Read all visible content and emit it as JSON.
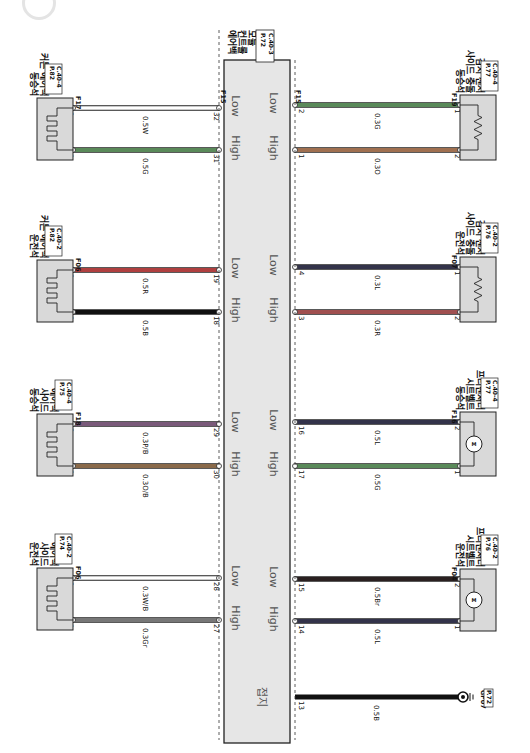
{
  "module": {
    "name_lines": [
      "에어백",
      "컨트롤",
      "모듈"
    ],
    "refs": [
      "P.72",
      "C.40-3"
    ],
    "ground_label": "접지"
  },
  "components": [
    {
      "id": "top-left-1",
      "name_lines": [
        "동승석",
        "커튼 에어백"
      ],
      "refs": [
        "P.82",
        "C.40-4"
      ],
      "connector": "F17",
      "type": "heater"
    },
    {
      "id": "top-left-2",
      "name_lines": [
        "운전석",
        "커튼 에어백"
      ],
      "refs": [
        "P.82",
        "C.40-2"
      ],
      "connector": "F06",
      "type": "heater"
    },
    {
      "id": "top-left-3",
      "name_lines": [
        "동승석",
        "사이드",
        "에어백"
      ],
      "refs": [
        "P.75",
        "C.40-4"
      ],
      "connector": "F18",
      "type": "heater"
    },
    {
      "id": "top-left-4",
      "name_lines": [
        "운전석",
        "사이드",
        "에어백"
      ],
      "refs": [
        "P.74",
        "C.40-2"
      ],
      "connector": "F06",
      "type": "heater"
    },
    {
      "id": "right-1",
      "name_lines": [
        "동승석",
        "사이드 충돌",
        "감지 센서"
      ],
      "refs": [
        "P.77",
        "C.40-4"
      ],
      "connector": "F19",
      "type": "resistor"
    },
    {
      "id": "right-2",
      "name_lines": [
        "운전석",
        "사이드 충돌",
        "감지 센서"
      ],
      "refs": [
        "P.76",
        "C.40-2"
      ],
      "connector": "F07",
      "type": "resistor"
    },
    {
      "id": "right-3",
      "name_lines": [
        "동승석",
        "시트벨트",
        "프리텐셔너"
      ],
      "refs": [
        "P.77",
        "C.40-4"
      ],
      "connector": "F16",
      "type": "motor"
    },
    {
      "id": "right-4",
      "name_lines": [
        "운전석",
        "시트벨트",
        "프리텐셔너"
      ],
      "refs": [
        "P.76",
        "C.40-2"
      ],
      "connector": "F04",
      "type": "motor"
    }
  ],
  "module_connectors": {
    "left": "F15",
    "right": "F15"
  },
  "pin_labels": {
    "low": "Low",
    "high": "High"
  },
  "wires_left": [
    {
      "y": 108,
      "wire": "0.5W",
      "pin_comp": "2",
      "pin_mod": "32",
      "color": "#ffffff",
      "level": "Low"
    },
    {
      "y": 150,
      "wire": "0.5G",
      "pin_comp": "1",
      "pin_mod": "31",
      "color": "#5a8a5a",
      "level": "High"
    },
    {
      "y": 270,
      "wire": "0.5R",
      "pin_comp": "2",
      "pin_mod": "19",
      "color": "#b04040",
      "level": "Low"
    },
    {
      "y": 312,
      "wire": "0.5B",
      "pin_comp": "1",
      "pin_mod": "18",
      "color": "#111111",
      "level": "High"
    },
    {
      "y": 424,
      "wire": "0.3P/B",
      "pin_comp": "2",
      "pin_mod": "29",
      "color": "#7a5a7a",
      "level": "Low"
    },
    {
      "y": 466,
      "wire": "0.3O/B",
      "pin_comp": "1",
      "pin_mod": "30",
      "color": "#8a6a4a",
      "level": "High"
    },
    {
      "y": 578,
      "wire": "0.3W/B",
      "pin_comp": "2",
      "pin_mod": "28",
      "color": "#ffffff",
      "level": "Low"
    },
    {
      "y": 620,
      "wire": "0.3Gr",
      "pin_comp": "1",
      "pin_mod": "27",
      "color": "#777777",
      "level": "High"
    }
  ],
  "wires_right": [
    {
      "y": 105,
      "wire": "0.3G",
      "pin_mod": "2",
      "pin_comp": "1",
      "color": "#5a8a5a",
      "level": "Low"
    },
    {
      "y": 150,
      "wire": "0.3O",
      "pin_mod": "1",
      "pin_comp": "2",
      "color": "#a07050",
      "level": "High"
    },
    {
      "y": 267,
      "wire": "0.3L",
      "pin_mod": "4",
      "pin_comp": "1",
      "color": "#33334a",
      "level": "Low"
    },
    {
      "y": 312,
      "wire": "0.3R",
      "pin_mod": "3",
      "pin_comp": "2",
      "color": "#a05050",
      "level": "High"
    },
    {
      "y": 422,
      "wire": "0.5L",
      "pin_mod": "16",
      "pin_comp": "2",
      "color": "#33334a",
      "level": "Low"
    },
    {
      "y": 466,
      "wire": "0.5G",
      "pin_mod": "17",
      "pin_comp": "1",
      "color": "#5a8a5a",
      "level": "High"
    },
    {
      "y": 579,
      "wire": "0.5Br",
      "pin_mod": "15",
      "pin_comp": "2",
      "color": "#2a2020",
      "level": "Low"
    },
    {
      "y": 621,
      "wire": "0.5L",
      "pin_mod": "14",
      "pin_comp": "1",
      "color": "#33334a",
      "level": "High"
    }
  ],
  "ground": {
    "y": 697,
    "wire": "0.5B",
    "pin_mod": "13",
    "label": "GF07",
    "ref": "P.72",
    "color": "#111111"
  }
}
